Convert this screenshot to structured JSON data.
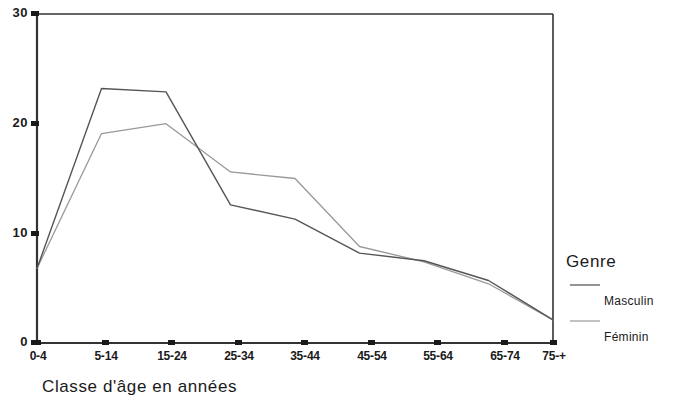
{
  "chart_data": {
    "type": "line",
    "title": "",
    "xlabel": "Classe d'âge en années",
    "ylabel": "",
    "categories": [
      "0-4",
      "5-14",
      "15-24",
      "25-34",
      "35-44",
      "45-54",
      "55-64",
      "65-74",
      "75-+"
    ],
    "series": [
      {
        "name": "Masculin",
        "values": [
          6.8,
          23.2,
          22.9,
          12.6,
          11.3,
          8.2,
          7.5,
          5.7,
          2.1
        ],
        "color": "#555555"
      },
      {
        "name": "Féminin",
        "values": [
          6.8,
          19.1,
          20.0,
          15.6,
          15.0,
          8.8,
          7.4,
          5.4,
          2.1
        ],
        "color": "#999999"
      }
    ],
    "ylim": [
      0,
      30
    ],
    "yticks": [
      0,
      10,
      20,
      30
    ],
    "ytick_labels": [
      "0",
      "10",
      "20",
      "30"
    ],
    "grid": false,
    "legend_position": "right",
    "legend": {
      "title": "Genre",
      "entries": [
        "Masculin",
        "Féminin"
      ]
    }
  },
  "axis": {
    "y_labels": [
      "30",
      "20",
      "10",
      "0"
    ],
    "x_labels": [
      "0-4",
      "5-14",
      "15-24",
      "25-34",
      "35-44",
      "45-54",
      "55-64",
      "65-74",
      "75-+"
    ],
    "x_title": "Classe d'âge en années"
  },
  "legend": {
    "title": "Genre",
    "masculin": "Masculin",
    "feminin": "Féminin"
  }
}
